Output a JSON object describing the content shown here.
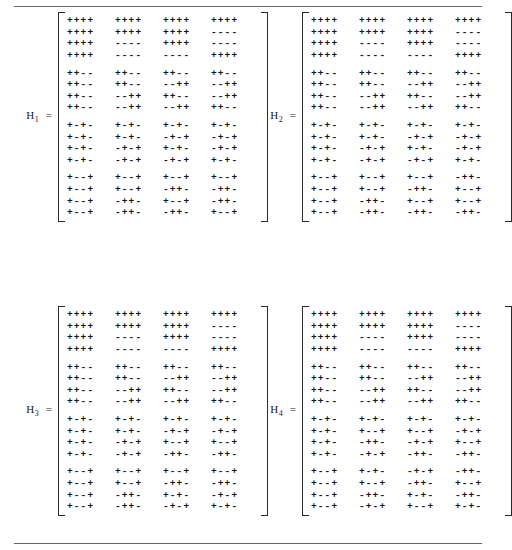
{
  "page": {
    "rule_top": "horizontal-rule",
    "rule_bottom": "horizontal-rule"
  },
  "matrices": [
    {
      "id": "H1",
      "name": "H",
      "subscript": "1",
      "equals": "=",
      "rows": [
        [
          "++++",
          "++++",
          "++++",
          "++++"
        ],
        [
          "++++",
          "++++",
          "++++",
          "----"
        ],
        [
          "++++",
          "----",
          "++++",
          "----"
        ],
        [
          "++++",
          "----",
          "----",
          "++++"
        ],
        [
          "++--",
          "++--",
          "++--",
          "++--"
        ],
        [
          "++--",
          "++--",
          "--++",
          "--++"
        ],
        [
          "++--",
          "--++",
          "++--",
          "--++"
        ],
        [
          "++--",
          "--++",
          "--++",
          "++--"
        ],
        [
          "+-+-",
          "+-+-",
          "+-+-",
          "+-+-"
        ],
        [
          "+-+-",
          "+-+-",
          "-+-+",
          "-+-+"
        ],
        [
          "+-+-",
          "-+-+",
          "+-+-",
          "-+-+"
        ],
        [
          "+-+-",
          "-+-+",
          "-+-+",
          "+-+-"
        ],
        [
          "+--+",
          "+--+",
          "+--+",
          "+--+"
        ],
        [
          "+--+",
          "+--+",
          "-++-",
          "-++-"
        ],
        [
          "+--+",
          "-++-",
          "+--+",
          "-++-"
        ],
        [
          "+--+",
          "-++-",
          "-++-",
          "+--+"
        ]
      ]
    },
    {
      "id": "H2",
      "name": "H",
      "subscript": "2",
      "equals": "=",
      "rows": [
        [
          "++++",
          "++++",
          "++++",
          "++++"
        ],
        [
          "++++",
          "++++",
          "++++",
          "----"
        ],
        [
          "++++",
          "----",
          "++++",
          "----"
        ],
        [
          "++++",
          "----",
          "----",
          "++++"
        ],
        [
          "++--",
          "++--",
          "++--",
          "++--"
        ],
        [
          "++--",
          "++--",
          "--++",
          "--++"
        ],
        [
          "++--",
          "--++",
          "++--",
          "--++"
        ],
        [
          "++--",
          "--++",
          "--++",
          "++--"
        ],
        [
          "+-+-",
          "+-+-",
          "+-+-",
          "+-+-"
        ],
        [
          "+-+-",
          "+-+-",
          "-+-+",
          "-+-+"
        ],
        [
          "+-+-",
          "-+-+",
          "+-+-",
          "-+-+"
        ],
        [
          "+-+-",
          "-+-+",
          "-+-+",
          "+-+-"
        ],
        [
          "+--+",
          "+--+",
          "+--+",
          "-++-"
        ],
        [
          "+--+",
          "+--+",
          "-++-",
          "+--+"
        ],
        [
          "+--+",
          "-++-",
          "+--+",
          "+--+"
        ],
        [
          "+--+",
          "-++-",
          "-++-",
          "-++-"
        ]
      ]
    },
    {
      "id": "H3",
      "name": "H",
      "subscript": "3",
      "equals": "=",
      "rows": [
        [
          "++++",
          "++++",
          "++++",
          "++++"
        ],
        [
          "++++",
          "++++",
          "++++",
          "----"
        ],
        [
          "++++",
          "----",
          "++++",
          "----"
        ],
        [
          "++++",
          "----",
          "----",
          "++++"
        ],
        [
          "++--",
          "++--",
          "++--",
          "++--"
        ],
        [
          "++--",
          "++--",
          "--++",
          "--++"
        ],
        [
          "++--",
          "--++",
          "++--",
          "--++"
        ],
        [
          "++--",
          "--++",
          "--++",
          "++--"
        ],
        [
          "+-+-",
          "+-+-",
          "+-+-",
          "+-+-"
        ],
        [
          "+-+-",
          "+-+-",
          "-+-+",
          "-+-+"
        ],
        [
          "+-+-",
          "-+-+",
          "+--+",
          "+--+"
        ],
        [
          "+-+-",
          "-+-+",
          "-++-",
          "-++-"
        ],
        [
          "+--+",
          "+--+",
          "+--+",
          "+--+"
        ],
        [
          "+--+",
          "+--+",
          "-++-",
          "-++-"
        ],
        [
          "+--+",
          "-++-",
          "+-+-",
          "-+-+"
        ],
        [
          "+--+",
          "-++-",
          "-+-+",
          "+-+-"
        ]
      ]
    },
    {
      "id": "H4",
      "name": "H",
      "subscript": "4",
      "equals": "=",
      "rows": [
        [
          "++++",
          "++++",
          "++++",
          "++++"
        ],
        [
          "++++",
          "++++",
          "++++",
          "----"
        ],
        [
          "++++",
          "----",
          "++++",
          "----"
        ],
        [
          "++++",
          "----",
          "----",
          "++++"
        ],
        [
          "++--",
          "++--",
          "++--",
          "++--"
        ],
        [
          "++--",
          "++--",
          "--++",
          "--++"
        ],
        [
          "++--",
          "--++",
          "++--",
          "--++"
        ],
        [
          "++--",
          "--++",
          "--++",
          "++--"
        ],
        [
          "+-+-",
          "+-+-",
          "+-+-",
          "+-+-"
        ],
        [
          "+-+-",
          "+--+",
          "+--+",
          "-+-+"
        ],
        [
          "+-+-",
          "-++-",
          "-+-+",
          "+--+"
        ],
        [
          "+-+-",
          "-+-+",
          "-++-",
          "-++-"
        ],
        [
          "+--+",
          "+-+-",
          "-+-+",
          "-++-"
        ],
        [
          "+--+",
          "+--+",
          "-++-",
          "+--+"
        ],
        [
          "+--+",
          "-++-",
          "+-+-",
          "-++-"
        ],
        [
          "+--+",
          "-+-+",
          "+--+",
          "+-+-"
        ]
      ]
    }
  ]
}
